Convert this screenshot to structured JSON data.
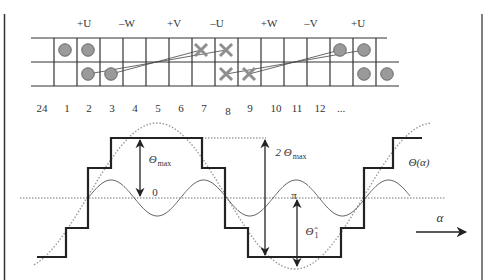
{
  "diagram": {
    "type": "winding-layout-and-mmf-waveform",
    "colors": {
      "line": "#2a2a2a",
      "grid": "#333333",
      "conductor_fill": "#9a9a9a",
      "cross": "#8f8f8f",
      "dotted": "#8a8a8a",
      "text": "#333333"
    },
    "phase_labels": [
      {
        "text": "+U",
        "x": 84
      },
      {
        "text": "–W",
        "x": 127
      },
      {
        "text": "+V",
        "x": 174
      },
      {
        "text": "–U",
        "x": 217
      },
      {
        "text": "+W",
        "x": 269
      },
      {
        "text": "–V",
        "x": 311
      },
      {
        "text": "+U",
        "x": 358
      }
    ],
    "slot_numbers": [
      {
        "text": "24",
        "x": 42
      },
      {
        "text": "1",
        "x": 67
      },
      {
        "text": "2",
        "x": 89
      },
      {
        "text": "3",
        "x": 112
      },
      {
        "text": "4",
        "x": 135
      },
      {
        "text": "5",
        "x": 158
      },
      {
        "text": "6",
        "x": 181
      },
      {
        "text": "7",
        "x": 204
      },
      {
        "text": "8",
        "x": 228
      },
      {
        "text": "9",
        "x": 250
      },
      {
        "text": "10",
        "x": 276
      },
      {
        "text": "11",
        "x": 297
      },
      {
        "text": "12",
        "x": 320
      },
      {
        "text": "...",
        "x": 341
      }
    ],
    "conductors": {
      "dots_top": [
        65,
        88,
        340,
        364
      ],
      "dots_bottom": [
        88,
        111,
        364,
        387
      ],
      "crosses_top": [
        201,
        226
      ],
      "crosses_bottom": [
        226,
        249
      ]
    },
    "labels": {
      "theta_max": "Θ",
      "theta_max_sub": "max",
      "two_theta_max": "2 Θ",
      "two_theta_max_sub": "max",
      "zero": "0",
      "pi": "π",
      "theta_hat": "Θ̂",
      "theta_hat_sub": "1",
      "theta_alpha": "Θ(α)",
      "alpha": "α"
    }
  }
}
